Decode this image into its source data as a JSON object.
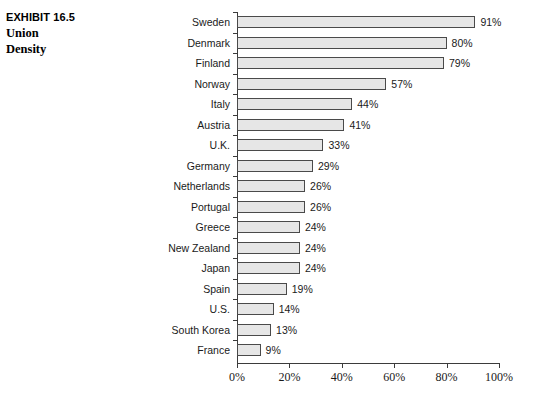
{
  "exhibit": {
    "number": "EXHIBIT 16.5",
    "name_lines": [
      "Union",
      "Density"
    ]
  },
  "chart_data": {
    "type": "bar",
    "orientation": "horizontal",
    "title": "Union Density",
    "xlabel": "",
    "ylabel": "",
    "xlim": [
      0,
      100
    ],
    "xticks": [
      "0%",
      "20%",
      "40%",
      "60%",
      "80%",
      "100%"
    ],
    "xtick_values": [
      0,
      20,
      40,
      60,
      80,
      100
    ],
    "grid": false,
    "legend": false,
    "bar_fill_color": "#e6e6e6",
    "bar_border_color": "#4a4a4a",
    "categories": [
      "Sweden",
      "Denmark",
      "Finland",
      "Norway",
      "Italy",
      "Austria",
      "U.K.",
      "Germany",
      "Netherlands",
      "Portugal",
      "Greece",
      "New Zealand",
      "Japan",
      "Spain",
      "U.S.",
      "South Korea",
      "France"
    ],
    "values": [
      91,
      80,
      79,
      57,
      44,
      41,
      33,
      29,
      26,
      26,
      24,
      24,
      24,
      19,
      14,
      13,
      9
    ],
    "data_labels": [
      "91%",
      "80%",
      "79%",
      "57%",
      "44%",
      "41%",
      "33%",
      "29%",
      "26%",
      "26%",
      "24%",
      "24%",
      "24%",
      "19%",
      "14%",
      "13%",
      "9%"
    ]
  }
}
